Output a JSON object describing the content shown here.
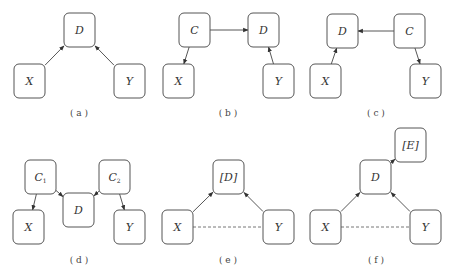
{
  "panels": [
    {
      "id": "a",
      "caption": "( a )",
      "nodes": [
        {
          "id": "D",
          "label": "D"
        },
        {
          "id": "X",
          "label": "X"
        },
        {
          "id": "Y",
          "label": "Y"
        }
      ],
      "edges": [
        {
          "from": "X",
          "to": "D",
          "style": "arrow"
        },
        {
          "from": "Y",
          "to": "D",
          "style": "arrow"
        }
      ]
    },
    {
      "id": "b",
      "caption": "( b )",
      "nodes": [
        {
          "id": "C",
          "label": "C"
        },
        {
          "id": "D",
          "label": "D"
        },
        {
          "id": "X",
          "label": "X"
        },
        {
          "id": "Y",
          "label": "Y"
        }
      ],
      "edges": [
        {
          "from": "C",
          "to": "D",
          "style": "arrow"
        },
        {
          "from": "C",
          "to": "X",
          "style": "arrow"
        },
        {
          "from": "Y",
          "to": "D",
          "style": "arrow"
        }
      ]
    },
    {
      "id": "c",
      "caption": "( c )",
      "nodes": [
        {
          "id": "D",
          "label": "D"
        },
        {
          "id": "C",
          "label": "C"
        },
        {
          "id": "X",
          "label": "X"
        },
        {
          "id": "Y",
          "label": "Y"
        }
      ],
      "edges": [
        {
          "from": "C",
          "to": "D",
          "style": "arrow"
        },
        {
          "from": "X",
          "to": "D",
          "style": "arrow"
        },
        {
          "from": "C",
          "to": "Y",
          "style": "arrow"
        }
      ]
    },
    {
      "id": "d",
      "caption": "( d )",
      "nodes": [
        {
          "id": "C1",
          "label": "C",
          "sub": "1"
        },
        {
          "id": "C2",
          "label": "C",
          "sub": "2"
        },
        {
          "id": "D",
          "label": "D"
        },
        {
          "id": "X",
          "label": "X"
        },
        {
          "id": "Y",
          "label": "Y"
        }
      ],
      "edges": [
        {
          "from": "C1",
          "to": "X",
          "style": "arrow"
        },
        {
          "from": "C1",
          "to": "D",
          "style": "arrow"
        },
        {
          "from": "C2",
          "to": "D",
          "style": "arrow"
        },
        {
          "from": "C2",
          "to": "Y",
          "style": "arrow"
        }
      ]
    },
    {
      "id": "e",
      "caption": "( e )",
      "nodes": [
        {
          "id": "D",
          "label": "[D]"
        },
        {
          "id": "X",
          "label": "X"
        },
        {
          "id": "Y",
          "label": "Y"
        }
      ],
      "edges": [
        {
          "from": "X",
          "to": "D",
          "style": "arrow"
        },
        {
          "from": "Y",
          "to": "D",
          "style": "arrow"
        },
        {
          "from": "X",
          "to": "Y",
          "style": "dashed"
        }
      ]
    },
    {
      "id": "f",
      "caption": "( f )",
      "nodes": [
        {
          "id": "E",
          "label": "[E]"
        },
        {
          "id": "D",
          "label": "D"
        },
        {
          "id": "X",
          "label": "X"
        },
        {
          "id": "Y",
          "label": "Y"
        }
      ],
      "edges": [
        {
          "from": "D",
          "to": "E",
          "style": "arrow"
        },
        {
          "from": "X",
          "to": "D",
          "style": "arrow"
        },
        {
          "from": "Y",
          "to": "D",
          "style": "arrow"
        },
        {
          "from": "X",
          "to": "Y",
          "style": "dashed"
        }
      ]
    }
  ]
}
